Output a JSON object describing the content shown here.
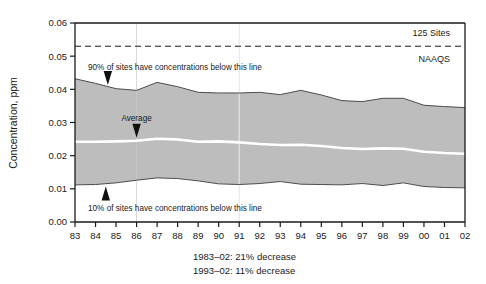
{
  "chart_data": {
    "type": "area",
    "title": "",
    "xlabel": "",
    "ylabel": "Concentration, ppm",
    "ylim": [
      0.0,
      0.06
    ],
    "yticks": [
      "0.00",
      "0.01",
      "0.02",
      "0.03",
      "0.04",
      "0.05",
      "0.06"
    ],
    "ytick_values": [
      0.0,
      0.01,
      0.02,
      0.03,
      0.04,
      0.05,
      0.06
    ],
    "grid": false,
    "legend_position": "inline-annotations",
    "categories": [
      "83",
      "84",
      "85",
      "86",
      "87",
      "88",
      "89",
      "90",
      "91",
      "92",
      "93",
      "94",
      "95",
      "96",
      "97",
      "98",
      "99",
      "00",
      "01",
      "02"
    ],
    "x_full_years": [
      1983,
      1984,
      1985,
      1986,
      1987,
      1988,
      1989,
      1990,
      1991,
      1992,
      1993,
      1994,
      1995,
      1996,
      1997,
      1998,
      1999,
      2000,
      2001,
      2002
    ],
    "series": [
      {
        "name": "90th percentile",
        "role": "band-upper",
        "color": "#4d4d4d",
        "values": [
          0.0432,
          0.0418,
          0.0402,
          0.0397,
          0.0421,
          0.0408,
          0.0391,
          0.0389,
          0.0389,
          0.0391,
          0.0384,
          0.0397,
          0.0383,
          0.0366,
          0.0363,
          0.0373,
          0.0373,
          0.0352,
          0.0348,
          0.0345
        ]
      },
      {
        "name": "Average",
        "role": "mean-line",
        "color": "#ffffff",
        "values": [
          0.0242,
          0.0242,
          0.0243,
          0.0245,
          0.0251,
          0.0249,
          0.0242,
          0.0243,
          0.024,
          0.0235,
          0.0232,
          0.0233,
          0.0229,
          0.0223,
          0.022,
          0.0222,
          0.0221,
          0.0212,
          0.0208,
          0.0206
        ]
      },
      {
        "name": "10th percentile",
        "role": "band-lower",
        "color": "#4d4d4d",
        "values": [
          0.0112,
          0.0113,
          0.0118,
          0.0126,
          0.0133,
          0.0131,
          0.0124,
          0.0115,
          0.0113,
          0.0116,
          0.0122,
          0.0114,
          0.0113,
          0.0112,
          0.0116,
          0.011,
          0.0118,
          0.0107,
          0.0104,
          0.0103
        ]
      }
    ],
    "band_fill_color": "#bdbdbd",
    "reference_line": {
      "name": "NAAQS",
      "value": 0.053,
      "style": "dashed",
      "color": "#1a1a1a",
      "label_above": "125 Sites",
      "label_below": "NAAQS"
    },
    "annotations": [
      {
        "name": "upper-band-annotation",
        "text": "90% of sites have concentrations below this line",
        "points_to_year": 1984.6,
        "points_to_value": 0.041
      },
      {
        "name": "average-annotation",
        "text": "Average",
        "points_to_year": 1986.0,
        "points_to_value": 0.0248
      },
      {
        "name": "lower-band-annotation",
        "text": "10% of sites have concentrations below this line",
        "points_to_year": 1984.5,
        "points_to_value": 0.0113
      }
    ]
  },
  "axes": {
    "y_title": "Concentration, ppm",
    "y_ticks": [
      "0.06",
      "0.05",
      "0.04",
      "0.03",
      "0.02",
      "0.01",
      "0.00"
    ],
    "x_ticks": [
      "83",
      "84",
      "85",
      "86",
      "87",
      "88",
      "89",
      "90",
      "91",
      "92",
      "93",
      "94",
      "95",
      "96",
      "97",
      "98",
      "99",
      "00",
      "01",
      "02"
    ]
  },
  "reference": {
    "sites_label": "125 Sites",
    "standard_label": "NAAQS"
  },
  "annotations": {
    "upper": "90% of sites have concentrations below this line",
    "average": "Average",
    "lower": "10% of sites have concentrations below this line"
  },
  "caption": {
    "line1": "1983–02: 21% decrease",
    "line2": "1993–02: 11% decrease"
  },
  "colors": {
    "band": "#bdbdbd",
    "band_edge": "#4d4d4d",
    "mean_line": "#ffffff",
    "axis": "#1a1a1a",
    "text": "#1a1a1a"
  }
}
